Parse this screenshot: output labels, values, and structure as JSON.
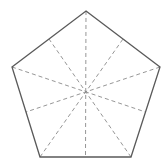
{
  "diagram": {
    "type": "regular-pentagon-with-symmetry-axes",
    "shape": "pentagon",
    "vertices": [
      [
        86,
        11
      ],
      [
        160,
        67
      ],
      [
        131,
        157
      ],
      [
        40,
        157
      ],
      [
        12,
        67
      ]
    ],
    "center": [
      86,
      91
    ],
    "edge_midpoints": [
      [
        123,
        39
      ],
      [
        145.5,
        112
      ],
      [
        85.5,
        157
      ],
      [
        26,
        112
      ],
      [
        49,
        39
      ]
    ],
    "axes_count": 5,
    "colors": {
      "background": "#ffffff",
      "edge": "#5a5a5a",
      "dashed_line": "#8a8a8a"
    },
    "edge_width": 1.3,
    "dash_width": 0.9,
    "dash_pattern": "4 3"
  }
}
